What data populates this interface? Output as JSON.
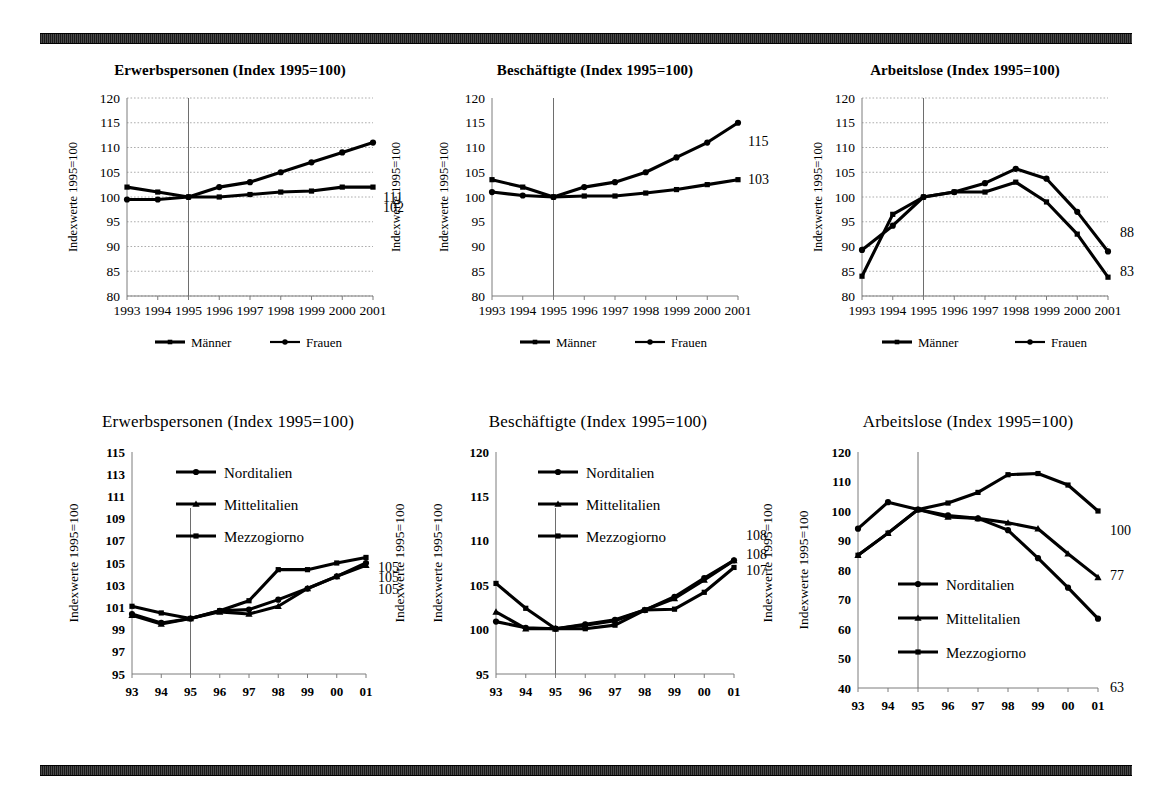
{
  "page": {
    "background": "#ffffff",
    "rule_color": "#2b2b2b"
  },
  "axis_label_text": "Indexwerte 1995=100",
  "legend_labels": {
    "maenner": "Männer",
    "frauen": "Frauen",
    "norditalien": "Norditalien",
    "mittelitalien": "Mittelitalien",
    "mezzogiorno": "Mezzogiorno"
  },
  "chart_data": [
    {
      "id": "top-left",
      "type": "line",
      "title": "Erwerbspersonen (Index 1995=100)",
      "xlabel": "",
      "ylabel": "Indexwerte 1995=100",
      "categories": [
        "1993",
        "1994",
        "1995",
        "1996",
        "1997",
        "1998",
        "1999",
        "2000",
        "2001"
      ],
      "ylim": [
        80,
        120
      ],
      "yticks": [
        80,
        85,
        90,
        95,
        100,
        105,
        110,
        115,
        120
      ],
      "grid": true,
      "reference_line_x": "1995",
      "legend_position": "bottom",
      "series": [
        {
          "name": "Männer",
          "marker": "square",
          "values": [
            102,
            101,
            100,
            100,
            100.5,
            101,
            101.2,
            102,
            102
          ],
          "end_label": "102"
        },
        {
          "name": "Frauen",
          "marker": "circle",
          "values": [
            99.5,
            99.5,
            100,
            102,
            103,
            105,
            107,
            109,
            111
          ],
          "end_label": "111"
        }
      ]
    },
    {
      "id": "top-middle",
      "type": "line",
      "title": "Beschäftigte (Index 1995=100)",
      "xlabel": "",
      "ylabel": "Indexwerte 1995=100",
      "categories": [
        "1993",
        "1994",
        "1995",
        "1996",
        "1997",
        "1998",
        "1999",
        "2000",
        "2001"
      ],
      "ylim": [
        80,
        120
      ],
      "yticks": [
        80,
        85,
        90,
        95,
        100,
        105,
        110,
        115,
        120
      ],
      "grid": false,
      "reference_line_x": "1995",
      "legend_position": "bottom",
      "series": [
        {
          "name": "Männer",
          "marker": "square",
          "values": [
            103.5,
            102,
            100,
            100.2,
            100.2,
            100.8,
            101.5,
            102.5,
            103.5
          ],
          "end_label": "103"
        },
        {
          "name": "Frauen",
          "marker": "circle",
          "values": [
            101,
            100.3,
            100,
            102,
            103,
            105,
            108,
            111,
            115
          ],
          "end_label": "115"
        }
      ]
    },
    {
      "id": "top-right",
      "type": "line",
      "title": "Arbeitslose (Index 1995=100)",
      "xlabel": "",
      "ylabel": "Indexwerte 1995=100",
      "categories": [
        "1993",
        "1994",
        "1995",
        "1996",
        "1997",
        "1998",
        "1999",
        "2000",
        "2001"
      ],
      "ylim": [
        80,
        120
      ],
      "yticks": [
        80,
        85,
        90,
        95,
        100,
        105,
        110,
        115,
        120
      ],
      "grid": true,
      "reference_line_x": "1995",
      "legend_position": "bottom",
      "series": [
        {
          "name": "Männer",
          "marker": "square",
          "values": [
            84,
            96.5,
            100,
            101,
            101,
            103,
            99,
            92.5,
            83.8
          ],
          "end_label": "83"
        },
        {
          "name": "Frauen",
          "marker": "circle",
          "values": [
            89.3,
            94.2,
            100,
            101,
            102.8,
            105.7,
            103.7,
            97,
            89
          ],
          "end_label": "88"
        }
      ]
    },
    {
      "id": "bottom-left",
      "type": "line",
      "title": "Erwerbspersonen (Index 1995=100)",
      "xlabel": "",
      "ylabel": "Indexwerte 1995=100",
      "categories": [
        "93",
        "94",
        "95",
        "96",
        "97",
        "98",
        "99",
        "00",
        "01"
      ],
      "ylim": [
        95,
        115
      ],
      "yticks": [
        95,
        97,
        99,
        101,
        103,
        105,
        107,
        109,
        111,
        113,
        115
      ],
      "grid": false,
      "reference_line_x": "95",
      "legend_position": "inside-top",
      "series": [
        {
          "name": "Norditalien",
          "marker": "circle",
          "values": [
            100.4,
            99.6,
            100,
            100.7,
            100.8,
            101.7,
            102.7,
            103.8,
            105.0
          ],
          "end_label": "105"
        },
        {
          "name": "Mittelitalien",
          "marker": "triangle",
          "values": [
            100.3,
            99.5,
            100,
            100.6,
            100.4,
            101.1,
            102.7,
            103.8,
            104.8
          ],
          "end_label": "105"
        },
        {
          "name": "Mezzogiorno",
          "marker": "square",
          "values": [
            101.1,
            100.5,
            100,
            100.7,
            101.6,
            104.4,
            104.4,
            105.0,
            105.5
          ],
          "end_label": "105"
        }
      ]
    },
    {
      "id": "bottom-middle",
      "type": "line",
      "title": "Beschäftigte (Index 1995=100)",
      "xlabel": "",
      "ylabel": "Indexwerte 1995=100",
      "categories": [
        "93",
        "94",
        "95",
        "96",
        "97",
        "98",
        "99",
        "00",
        "01"
      ],
      "ylim": [
        95,
        120
      ],
      "yticks": [
        95,
        100,
        105,
        110,
        115,
        120
      ],
      "grid": false,
      "reference_line_x": "95",
      "legend_position": "inside-top",
      "series": [
        {
          "name": "Norditalien",
          "marker": "circle",
          "values": [
            100.9,
            100.2,
            100.1,
            100.6,
            101.1,
            102.2,
            103.7,
            105.8,
            107.8
          ],
          "end_label": "108"
        },
        {
          "name": "Mittelitalien",
          "marker": "triangle",
          "values": [
            102.0,
            100.1,
            100.1,
            100.5,
            101.0,
            102.2,
            103.5,
            105.6,
            107.8
          ],
          "end_label": "108"
        },
        {
          "name": "Mezzogiorno",
          "marker": "square",
          "values": [
            105.2,
            102.4,
            100.1,
            100.1,
            100.5,
            102.2,
            102.3,
            104.2,
            107.0
          ],
          "end_label": "107"
        }
      ]
    },
    {
      "id": "bottom-right",
      "type": "line",
      "title": "Arbeitslose (Index 1995=100)",
      "xlabel": "",
      "ylabel": "Indexwerte 1995=100",
      "categories": [
        "93",
        "94",
        "95",
        "96",
        "97",
        "98",
        "99",
        "00",
        "01"
      ],
      "ylim": [
        40,
        120
      ],
      "yticks": [
        40,
        50,
        60,
        70,
        80,
        90,
        100,
        110,
        120
      ],
      "grid": false,
      "reference_line_x": "95",
      "legend_position": "inside-bottom",
      "series": [
        {
          "name": "Norditalien",
          "marker": "circle",
          "values": [
            94,
            103,
            100.5,
            98.5,
            97.5,
            93.5,
            84,
            74,
            63.5
          ],
          "end_label": "63"
        },
        {
          "name": "Mittelitalien",
          "marker": "triangle",
          "values": [
            85,
            92.5,
            100.5,
            98,
            97.5,
            96,
            94,
            85.5,
            77.5
          ],
          "end_label": "77"
        },
        {
          "name": "Mezzogiorno",
          "marker": "square",
          "values": [
            85,
            92.5,
            100.5,
            102.7,
            106.3,
            112.3,
            112.7,
            108.8,
            100
          ],
          "end_label": "100"
        }
      ]
    }
  ]
}
